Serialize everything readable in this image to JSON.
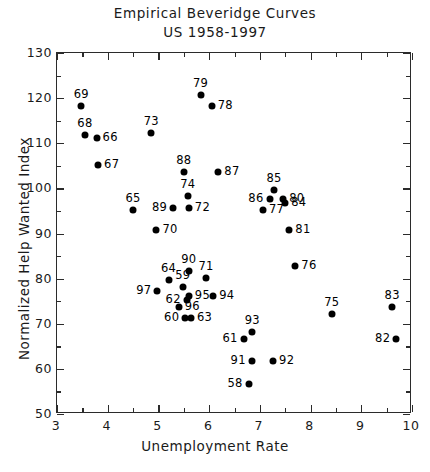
{
  "title": {
    "line1": "Empirical Beveridge Curves",
    "line2": "US 1958-1997"
  },
  "caption": "Figure 1",
  "chart_data": {
    "type": "scatter",
    "title": "Empirical Beveridge Curves US 1958-1997",
    "xlabel": "Unemployment Rate",
    "ylabel": "Normalized Help Wanted Index",
    "xlim": [
      3,
      10
    ],
    "ylim": [
      50,
      130
    ],
    "xticks": [
      3,
      4,
      5,
      6,
      7,
      8,
      9,
      10
    ],
    "yticks": [
      50,
      60,
      70,
      80,
      90,
      100,
      110,
      120,
      130
    ],
    "xtick_labels": [
      "3",
      "4",
      "5",
      "6",
      "7",
      "8",
      "9",
      "10"
    ],
    "ytick_labels": [
      "50",
      "60",
      "70",
      "80",
      "90",
      "100",
      "110",
      "120",
      "130"
    ],
    "xminor_step": 0.5,
    "yminor_step": 5,
    "grid": false,
    "legend": false,
    "marker": "filled-circle",
    "marker_color": "#000000",
    "point_label_key": "two-digit year",
    "points": [
      {
        "label": "58",
        "x": 6.8,
        "y": 56.5,
        "pos": "left"
      },
      {
        "label": "59",
        "x": 5.5,
        "y": 78.0,
        "pos": "above"
      },
      {
        "label": "60",
        "x": 5.55,
        "y": 71.0,
        "pos": "left"
      },
      {
        "label": "61",
        "x": 6.7,
        "y": 66.5,
        "pos": "left"
      },
      {
        "label": "62",
        "x": 5.58,
        "y": 75.0,
        "pos": "left"
      },
      {
        "label": "63",
        "x": 5.66,
        "y": 71.0,
        "pos": "right"
      },
      {
        "label": "64",
        "x": 5.22,
        "y": 79.5,
        "pos": "above"
      },
      {
        "label": "65",
        "x": 4.52,
        "y": 95.0,
        "pos": "above"
      },
      {
        "label": "66",
        "x": 3.8,
        "y": 111.0,
        "pos": "right"
      },
      {
        "label": "67",
        "x": 3.83,
        "y": 105.0,
        "pos": "right"
      },
      {
        "label": "68",
        "x": 3.57,
        "y": 111.5,
        "pos": "above"
      },
      {
        "label": "69",
        "x": 3.5,
        "y": 118.0,
        "pos": "above"
      },
      {
        "label": "70",
        "x": 4.98,
        "y": 90.5,
        "pos": "right"
      },
      {
        "label": "71",
        "x": 5.96,
        "y": 80.0,
        "pos": "above"
      },
      {
        "label": "72",
        "x": 5.62,
        "y": 95.5,
        "pos": "right"
      },
      {
        "label": "73",
        "x": 4.88,
        "y": 112.0,
        "pos": "above"
      },
      {
        "label": "74",
        "x": 5.6,
        "y": 98.0,
        "pos": "above"
      },
      {
        "label": "75",
        "x": 8.44,
        "y": 72.0,
        "pos": "above"
      },
      {
        "label": "76",
        "x": 7.72,
        "y": 82.5,
        "pos": "right"
      },
      {
        "label": "77",
        "x": 7.08,
        "y": 95.0,
        "pos": "right"
      },
      {
        "label": "78",
        "x": 6.07,
        "y": 118.0,
        "pos": "right"
      },
      {
        "label": "79",
        "x": 5.85,
        "y": 120.5,
        "pos": "above"
      },
      {
        "label": "80",
        "x": 7.48,
        "y": 97.5,
        "pos": "right"
      },
      {
        "label": "81",
        "x": 7.6,
        "y": 90.5,
        "pos": "right"
      },
      {
        "label": "82",
        "x": 9.71,
        "y": 66.5,
        "pos": "left"
      },
      {
        "label": "83",
        "x": 9.63,
        "y": 73.5,
        "pos": "above"
      },
      {
        "label": "84",
        "x": 7.52,
        "y": 96.5,
        "pos": "right"
      },
      {
        "label": "85",
        "x": 7.3,
        "y": 99.5,
        "pos": "above"
      },
      {
        "label": "86",
        "x": 7.21,
        "y": 97.5,
        "pos": "left"
      },
      {
        "label": "87",
        "x": 6.2,
        "y": 103.5,
        "pos": "right"
      },
      {
        "label": "88",
        "x": 5.52,
        "y": 103.5,
        "pos": "above"
      },
      {
        "label": "89",
        "x": 5.31,
        "y": 95.5,
        "pos": "left"
      },
      {
        "label": "90",
        "x": 5.62,
        "y": 81.5,
        "pos": "above"
      },
      {
        "label": "91",
        "x": 6.86,
        "y": 61.5,
        "pos": "left"
      },
      {
        "label": "92",
        "x": 7.28,
        "y": 61.5,
        "pos": "right"
      },
      {
        "label": "93",
        "x": 6.87,
        "y": 68.0,
        "pos": "above"
      },
      {
        "label": "94",
        "x": 6.1,
        "y": 76.0,
        "pos": "right"
      },
      {
        "label": "95",
        "x": 5.62,
        "y": 76.0,
        "pos": "right"
      },
      {
        "label": "96",
        "x": 5.42,
        "y": 73.5,
        "pos": "right"
      },
      {
        "label": "97",
        "x": 5.0,
        "y": 77.0,
        "pos": "left"
      }
    ]
  }
}
